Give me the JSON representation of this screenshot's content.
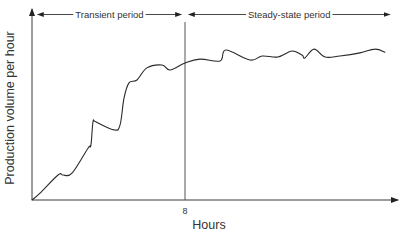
{
  "chart_data": {
    "type": "line",
    "title": "",
    "xlabel": "Hours",
    "ylabel": "Production volume per hour",
    "x_ticks": [
      {
        "value": 8,
        "label": "8"
      }
    ],
    "xlim": [
      0,
      19.5
    ],
    "ylim": [
      0,
      100
    ],
    "grid": false,
    "legend": "none",
    "reference_lines": [
      {
        "axis": "x",
        "value": 8
      }
    ],
    "annotations": [
      {
        "label": "Transient period",
        "from": 0.3,
        "to": 7.8,
        "type": "double-arrow"
      },
      {
        "label": "Steady-state period",
        "from": 8.2,
        "to": 18.7,
        "type": "double-arrow"
      }
    ],
    "series": [
      {
        "name": "Production volume",
        "x": [
          0,
          0.42,
          1.36,
          1.62,
          2.09,
          2.93,
          3.08,
          3.19,
          3.35,
          4.29,
          4.6,
          4.81,
          5.07,
          5.49,
          6.01,
          6.8,
          7.22,
          8.0,
          8.78,
          9.83,
          10.14,
          11.4,
          12.03,
          12.86,
          13.59,
          14.12,
          14.27,
          14.75,
          15.32,
          16.1,
          17.15,
          17.93,
          18.46
        ],
        "values": [
          0,
          3.6,
          13,
          13,
          14,
          27,
          28.6,
          40.6,
          40.6,
          36.5,
          39,
          53,
          61,
          62.5,
          68.8,
          70.3,
          67.7,
          71.4,
          73.4,
          72.4,
          78.1,
          72.9,
          75,
          74.5,
          77.6,
          75.5,
          74,
          78.6,
          74.5,
          75,
          76.6,
          78.6,
          77
        ]
      }
    ]
  }
}
